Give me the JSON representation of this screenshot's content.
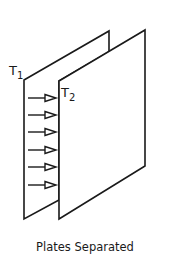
{
  "diagram": {
    "labels": {
      "plate1": "T",
      "plate1_sub": "1",
      "plate2": "T",
      "plate2_sub": "2"
    },
    "caption": "Plates Separated",
    "arrow_count": 6,
    "colors": {
      "stroke": "#1a1a1a",
      "background": "#ffffff"
    }
  }
}
